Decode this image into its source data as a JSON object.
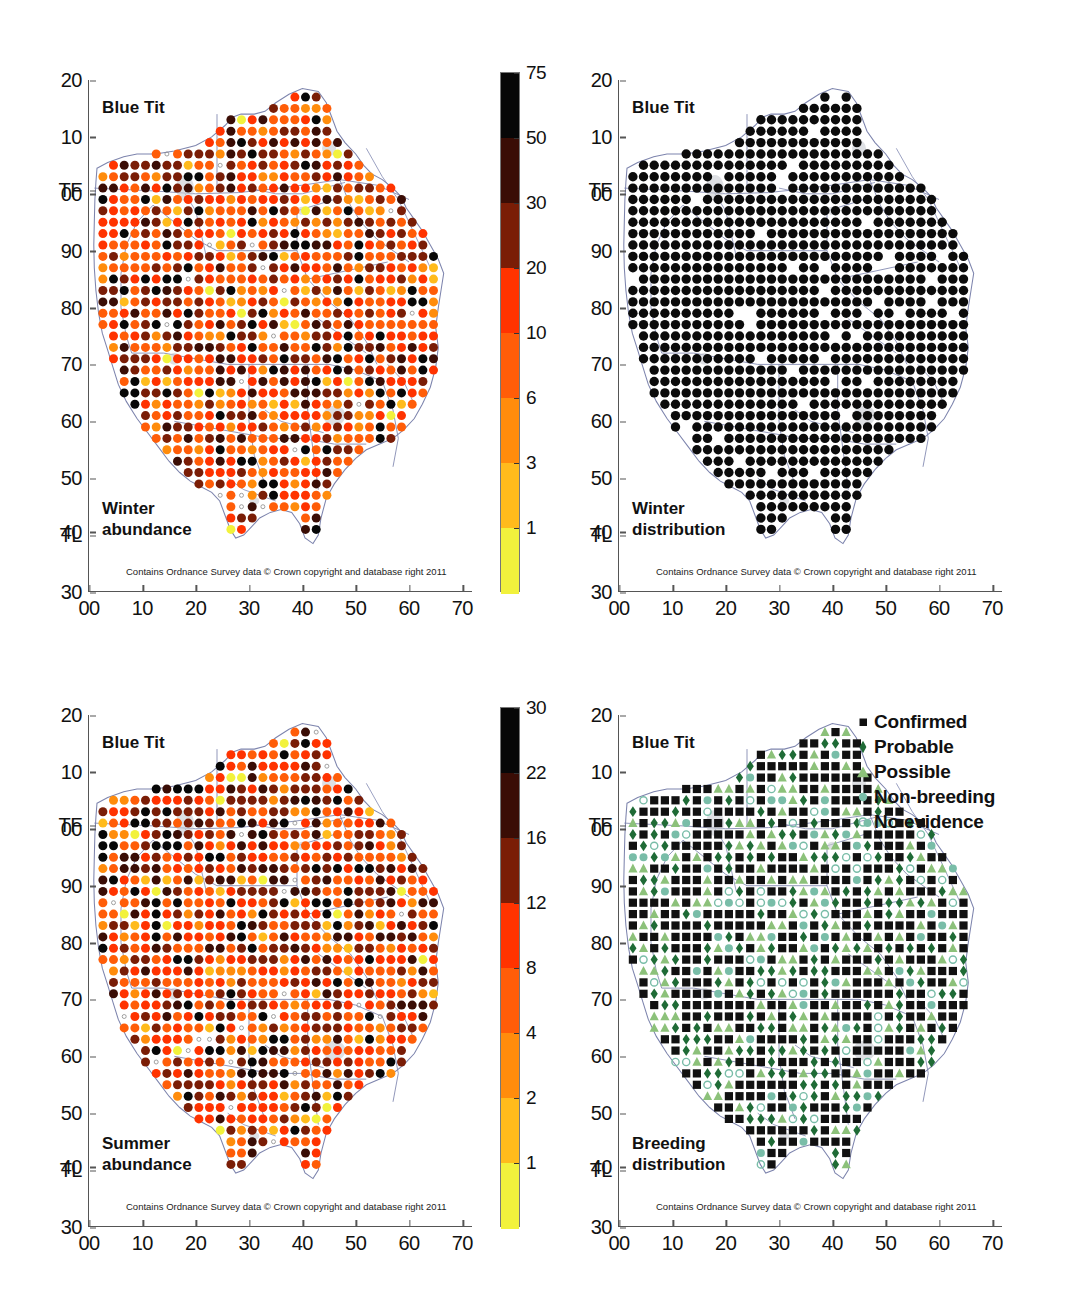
{
  "figure": {
    "species": "Blue Tit",
    "attribution": "Contains Ordnance Survey data © Crown copyright and database right 2011"
  },
  "axes": {
    "x_ticks": [
      "00",
      "10",
      "20",
      "30",
      "40",
      "50",
      "60",
      "70"
    ],
    "y_ticks": [
      "20",
      "10",
      "TF",
      "00",
      "90",
      "80",
      "70",
      "60",
      "50",
      "40",
      "TL",
      "30"
    ]
  },
  "panels": [
    {
      "id": "winter-abundance",
      "title": "Blue Tit",
      "corner_label": "Winter\nabundance",
      "corner_line1": "Winter",
      "corner_line2": "abundance",
      "type": "abundance",
      "colorbar": {
        "labels": [
          "75",
          "50",
          "30",
          "20",
          "10",
          "6",
          "3",
          "1"
        ],
        "colors": [
          "#070707",
          "#3a0d05",
          "#7a1d06",
          "#ff3300",
          "#ff5d08",
          "#ff8c0c",
          "#ffbb1c",
          "#f2f23c"
        ]
      }
    },
    {
      "id": "winter-distribution",
      "title": "Blue Tit",
      "corner_line1": "Winter",
      "corner_line2": "distribution",
      "type": "distribution-filled"
    },
    {
      "id": "summer-abundance",
      "title": "Blue Tit",
      "corner_line1": "Summer",
      "corner_line2": "abundance",
      "type": "abundance",
      "colorbar": {
        "labels": [
          "30",
          "22",
          "16",
          "12",
          "8",
          "4",
          "2",
          "1"
        ],
        "colors": [
          "#070707",
          "#3a0d05",
          "#7a1d06",
          "#ff3300",
          "#ff5d08",
          "#ff8c0c",
          "#ffbb1c",
          "#f2f23c"
        ]
      }
    },
    {
      "id": "breeding-distribution",
      "title": "Blue Tit",
      "corner_line1": "Breeding",
      "corner_line2": "distribution",
      "type": "breeding",
      "legend": [
        {
          "label": "Confirmed",
          "symbol": "square",
          "color": "#111111"
        },
        {
          "label": "Probable",
          "symbol": "diamond",
          "color": "#1f6b36"
        },
        {
          "label": "Possible",
          "symbol": "triangle",
          "color": "#8cc17a"
        },
        {
          "label": "Non-breeding",
          "symbol": "circle",
          "color": "#79bda8"
        },
        {
          "label": "No evidence",
          "symbol": "open-circle",
          "color": "#79bda8"
        }
      ]
    }
  ],
  "chart_data": {
    "type": "scatter",
    "xlabel": "Easting (OS grid, 10 km)",
    "ylabel": "Northing (OS grid, 10 km)",
    "xlim": [
      0,
      72
    ],
    "ylim": [
      30,
      120
    ],
    "grid": false,
    "x_tick_values": [
      0,
      10,
      20,
      30,
      40,
      50,
      60,
      70
    ],
    "x_tick_labels": [
      "00",
      "10",
      "20",
      "30",
      "40",
      "50",
      "60",
      "70"
    ],
    "y_tick_values": [
      120,
      110,
      100,
      100,
      90,
      80,
      70,
      60,
      50,
      40,
      40,
      30
    ],
    "y_tick_labels": [
      "20",
      "10",
      "TF",
      "00",
      "90",
      "80",
      "70",
      "60",
      "50",
      "40",
      "TL",
      "30"
    ],
    "panels": [
      {
        "name": "Winter abundance",
        "legend_position": "right-colorbar",
        "colorbar_breaks": [
          1,
          3,
          6,
          10,
          20,
          30,
          50,
          75
        ],
        "colorbar_colors": [
          "#f2f23c",
          "#ffbb1c",
          "#ff8c0c",
          "#ff5d08",
          "#ff3300",
          "#7a1d06",
          "#3a0d05",
          "#070707"
        ],
        "annotation": "Winter abundance",
        "n_occupied_cells": 947,
        "value_units": "birds per tetrad"
      },
      {
        "name": "Winter distribution",
        "legend_position": "none",
        "marker": "filled-black-circle",
        "annotation": "Winter distribution",
        "n_occupied_cells": 947
      },
      {
        "name": "Summer abundance",
        "legend_position": "right-colorbar",
        "colorbar_breaks": [
          1,
          2,
          4,
          8,
          12,
          16,
          22,
          30
        ],
        "colorbar_colors": [
          "#f2f23c",
          "#ffbb1c",
          "#ff8c0c",
          "#ff5d08",
          "#ff3300",
          "#7a1d06",
          "#3a0d05",
          "#070707"
        ],
        "annotation": "Summer abundance",
        "n_occupied_cells": 932,
        "value_units": "birds per tetrad"
      },
      {
        "name": "Breeding distribution",
        "legend_position": "top-right",
        "categories": [
          "Confirmed",
          "Probable",
          "Possible",
          "Non-breeding",
          "No evidence"
        ],
        "category_colors": [
          "#111111",
          "#1f6b36",
          "#8cc17a",
          "#79bda8",
          "#79bda8"
        ],
        "category_markers": [
          "square",
          "diamond",
          "triangle",
          "circle",
          "open-circle"
        ],
        "annotation": "Breeding distribution"
      }
    ]
  }
}
